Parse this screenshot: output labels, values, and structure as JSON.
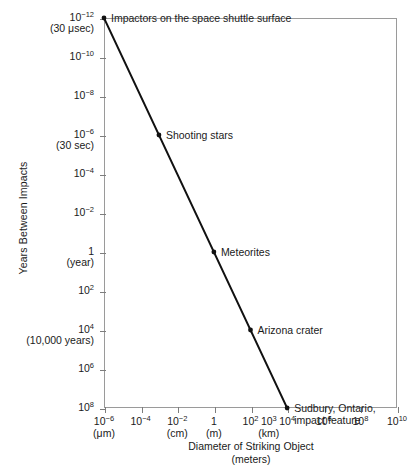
{
  "chart_data": {
    "type": "line",
    "title": "",
    "xlabel": "Diameter of Striking Object",
    "xlabel_units": "(meters)",
    "ylabel": "Years Between Impacts",
    "xscale": "log",
    "yscale": "log",
    "y_inverted": true,
    "xlim": [
      1e-06,
      10000000000.0
    ],
    "ylim": [
      1e-12,
      100000000.0
    ],
    "grid": false,
    "legend": "none",
    "x_ticks": [
      {
        "value": 1e-06,
        "label": "10",
        "exp": "−6",
        "sub": "(μm)"
      },
      {
        "value": 0.0001,
        "label": "10",
        "exp": "−4",
        "sub": ""
      },
      {
        "value": 0.01,
        "label": "10",
        "exp": "−2",
        "sub": "(cm)"
      },
      {
        "value": 1,
        "label": "1",
        "exp": "",
        "sub": "(m)"
      },
      {
        "value": 100,
        "label": "10",
        "exp": "2",
        "sub": ""
      },
      {
        "value": 10000,
        "label": "10",
        "exp": "4",
        "sub": ""
      },
      {
        "value": 1000000,
        "label": "10",
        "exp": "6",
        "sub": ""
      },
      {
        "value": 100000000,
        "label": "10",
        "exp": "8",
        "sub": ""
      },
      {
        "value": 10000000000,
        "label": "10",
        "exp": "10",
        "sub": ""
      }
    ],
    "x_extra_labels": [
      {
        "value": 1000,
        "label": "10",
        "exp": "3",
        "sub": "(km)"
      }
    ],
    "y_ticks": [
      {
        "value": 1e-12,
        "label": "10",
        "exp": "−12",
        "sub": "(30 μsec)"
      },
      {
        "value": 1e-10,
        "label": "10",
        "exp": "−10",
        "sub": ""
      },
      {
        "value": 1e-08,
        "label": "10",
        "exp": "−8",
        "sub": ""
      },
      {
        "value": 1e-06,
        "label": "10",
        "exp": "−6",
        "sub": "(30 sec)"
      },
      {
        "value": 0.0001,
        "label": "10",
        "exp": "−4",
        "sub": ""
      },
      {
        "value": 0.01,
        "label": "10",
        "exp": "−2",
        "sub": ""
      },
      {
        "value": 1,
        "label": "1",
        "exp": "",
        "sub": "(year)"
      },
      {
        "value": 100,
        "label": "10",
        "exp": "2",
        "sub": ""
      },
      {
        "value": 10000,
        "label": "10",
        "exp": "4",
        "sub": "(10,000 years)"
      },
      {
        "value": 1000000,
        "label": "10",
        "exp": "6",
        "sub": ""
      },
      {
        "value": 100000000,
        "label": "10",
        "exp": "8",
        "sub": ""
      }
    ],
    "series": [
      {
        "name": "impact frequency",
        "color": "#111111",
        "points": [
          {
            "x": 1e-06,
            "y": 1e-12,
            "label": "Impactors on the space shuttle surface",
            "label2": ""
          },
          {
            "x": 0.001,
            "y": 1e-06,
            "label": "Shooting stars",
            "label2": ""
          },
          {
            "x": 1,
            "y": 1,
            "label": "Meteorites",
            "label2": ""
          },
          {
            "x": 100,
            "y": 10000,
            "label": "Arizona crater",
            "label2": ""
          },
          {
            "x": 10000,
            "y": 100000000,
            "label": "Sudbury, Ontario,",
            "label2": "impact feature"
          }
        ]
      }
    ]
  }
}
